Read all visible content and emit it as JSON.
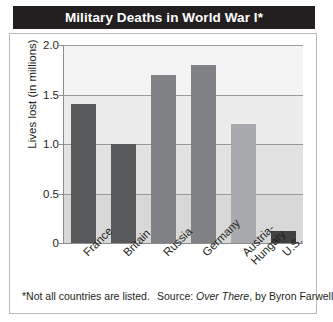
{
  "figure": {
    "title": "Military Deaths in World War I*",
    "footnote": "*Not all countries are listed.",
    "source_prefix": "Source: ",
    "source_title": "Over There",
    "source_suffix": ", by Byron Farwell"
  },
  "chart_data": {
    "type": "bar",
    "title": "Military Deaths in World War I*",
    "xlabel": "",
    "ylabel": "Lives lost (in millions)",
    "ylim": [
      0,
      2.0
    ],
    "yticks": [
      "0",
      "0.5",
      "1.0",
      "1.5",
      "2.0"
    ],
    "ytick_values": [
      0,
      0.5,
      1.0,
      1.5,
      2.0
    ],
    "grid": true,
    "legend": "none",
    "categories": [
      "France",
      "Britain",
      "Russia",
      "Germany",
      "Austria-Hungary",
      "U.S."
    ],
    "category_lines": [
      [
        "France"
      ],
      [
        "Britain"
      ],
      [
        "Russia"
      ],
      [
        "Germany"
      ],
      [
        "Austria-",
        "Hungary"
      ],
      [
        "U.S."
      ]
    ],
    "values": [
      1.4,
      1.0,
      1.7,
      1.8,
      1.2,
      0.12
    ],
    "bar_colors": [
      "#58595b",
      "#58595b",
      "#808285",
      "#808285",
      "#a7a9ac",
      "#414042"
    ],
    "band_colors": [
      "#f4f4f4",
      "#ececec",
      "#e2e2e2",
      "#d8d8d8"
    ],
    "gridline_color": "#9a9a9a",
    "axis_color": "#8d8d8d"
  }
}
